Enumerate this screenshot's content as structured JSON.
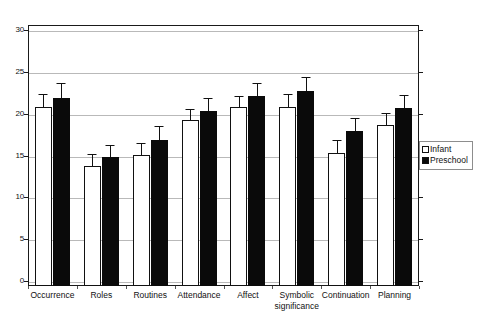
{
  "chart_data": {
    "type": "bar",
    "title": "",
    "subtitle": "",
    "xlabel": "",
    "ylabel": "",
    "ylim": [
      0,
      30
    ],
    "ytick_values": [
      0,
      5,
      10,
      15,
      20,
      25,
      30
    ],
    "ytick_labels": [
      "0",
      "5",
      "10",
      "15",
      "20",
      "25",
      "30"
    ],
    "grid": true,
    "grid_axis": "y",
    "legend_position": "right-outside",
    "error_bars": "symmetric",
    "categories": [
      "Occurrence",
      "Roles",
      "Routines",
      "Attendance",
      "Affect",
      "Symbolic\nsignificance",
      "Continuation",
      "Planning"
    ],
    "series": [
      {
        "name": "Infant",
        "color": "#ffffff",
        "edge_color": "#111111",
        "values": [
          20.8,
          13.7,
          15.1,
          19.3,
          20.8,
          20.8,
          15.3,
          18.6
        ],
        "errors": [
          1.6,
          1.5,
          1.4,
          1.3,
          1.3,
          1.6,
          1.6,
          1.5
        ]
      },
      {
        "name": "Preschool",
        "color": "#0a0a0a",
        "edge_color": "#0a0a0a",
        "values": [
          21.9,
          14.8,
          16.8,
          20.3,
          22.1,
          22.7,
          17.9,
          20.7
        ],
        "errors": [
          1.8,
          1.5,
          1.7,
          1.6,
          1.6,
          1.7,
          1.6,
          1.5
        ]
      }
    ]
  },
  "legend": {
    "items": [
      {
        "label": "Infant",
        "marker": "open-square-marker"
      },
      {
        "label": "Preschool",
        "marker": "filled-square-marker"
      }
    ]
  },
  "colors": {
    "infant_fill": "#ffffff",
    "preschool_fill": "#0a0a0a",
    "gridline": "#b9b9b9",
    "frame": "#1a1a1a",
    "text": "#111111"
  }
}
